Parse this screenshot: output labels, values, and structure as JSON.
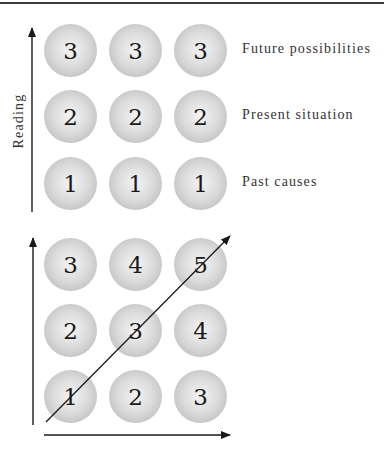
{
  "top_diagram": {
    "axis_label": "Reading",
    "rows": [
      {
        "label": "Future possibilities",
        "values": [
          "3",
          "3",
          "3"
        ]
      },
      {
        "label": "Present situation",
        "values": [
          "2",
          "2",
          "2"
        ]
      },
      {
        "label": "Past causes",
        "values": [
          "1",
          "1",
          "1"
        ]
      }
    ]
  },
  "bottom_diagram": {
    "rows": [
      {
        "values": [
          "3",
          "4",
          "5"
        ]
      },
      {
        "values": [
          "2",
          "3",
          "4"
        ]
      },
      {
        "values": [
          "1",
          "2",
          "3"
        ]
      }
    ]
  },
  "colors": {
    "line": "#1a1a1a",
    "ball": "#d0d0d0",
    "text": "#333333"
  }
}
